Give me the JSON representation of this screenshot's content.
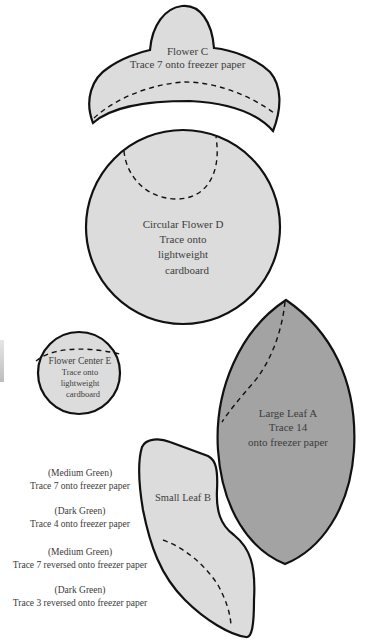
{
  "colors": {
    "piece_light": "#dcdcdc",
    "piece_dark": "#a3a3a3",
    "outline": "#111111",
    "text": "#3c3c3c"
  },
  "pieces": {
    "flower_c": {
      "name": "Flower C",
      "instruction": "Trace 7 onto freezer paper"
    },
    "flower_d": {
      "name": "Circular Flower D",
      "line2": "Trace onto",
      "line3": "lightweight",
      "line4": "cardboard"
    },
    "flower_center_e": {
      "name": "Flower Center E",
      "line2": "Trace onto",
      "line3": "lightweight",
      "line4": "cardboard"
    },
    "large_leaf_a": {
      "name": "Large Leaf A",
      "line2": "Trace 14",
      "line3": "onto freezer paper"
    },
    "small_leaf_b": {
      "name": "Small Leaf B"
    }
  },
  "notes": [
    {
      "color": "(Medium Green)",
      "instruction": "Trace 7 onto freezer paper"
    },
    {
      "color": "(Dark Green)",
      "instruction": "Trace 4 onto  freezer paper"
    },
    {
      "color": "(Medium Green)",
      "instruction": "Trace 7 reversed onto freezer paper"
    },
    {
      "color": "(Dark Green)",
      "instruction": "Trace 3 reversed onto freezer paper"
    }
  ]
}
